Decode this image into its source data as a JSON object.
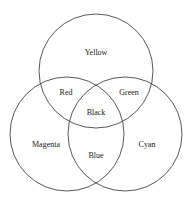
{
  "diagram": {
    "type": "venn-3",
    "circles": [
      {
        "name": "yellow",
        "cx": 96,
        "cy": 71,
        "r": 57
      },
      {
        "name": "magenta",
        "cx": 67,
        "cy": 134,
        "r": 57
      },
      {
        "name": "cyan",
        "cx": 125,
        "cy": 134,
        "r": 57
      }
    ],
    "labels": {
      "yellow": "Yellow",
      "red": "Red",
      "green": "Green",
      "black": "Black",
      "magenta": "Magenta",
      "cyan": "Cyan",
      "blue": "Blue"
    }
  }
}
